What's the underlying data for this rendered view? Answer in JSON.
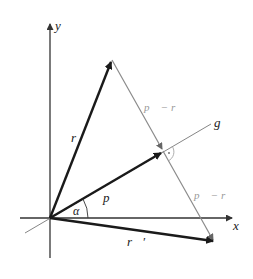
{
  "diagram": {
    "axes": {
      "x_label": "x",
      "y_label": "y"
    },
    "line_label": "g",
    "vectors": [
      {
        "name": "r",
        "label": "r⃗"
      },
      {
        "name": "p",
        "label": "p⃗"
      },
      {
        "name": "r_prime",
        "label": "r⃗′"
      }
    ],
    "difference_labels": [
      "p⃗ − r⃗",
      "p⃗ − r⃗"
    ],
    "angle_label": "α",
    "colors": {
      "vector": "#1a1a1a",
      "axis": "#333333",
      "difference": "#8a8a8a",
      "line_g": "#777777"
    }
  }
}
